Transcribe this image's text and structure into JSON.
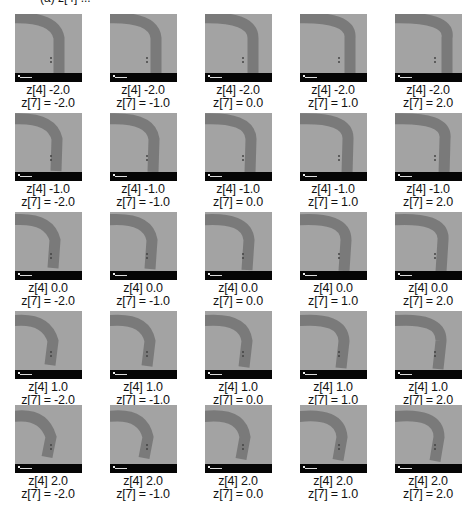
{
  "top_cutoff_text": "(a) z[4] ...",
  "colors": {
    "tile_bg": "#a3a3a3",
    "band": "#767676",
    "scale_bar": "#050505"
  },
  "grid": {
    "rows": 5,
    "cols": 5,
    "row_values": [
      "-2.0",
      "-1.0",
      "0.0",
      "1.0",
      "2.0"
    ],
    "col_values": [
      "-2.0",
      "-1.0",
      "0.0",
      "1.0",
      "2.0"
    ],
    "cells": [
      [
        {
          "l1": "z[4] -2.0",
          "l2": "z[7] = -2.0"
        },
        {
          "l1": "z[4] -2.0",
          "l2": "z[7] = -1.0"
        },
        {
          "l1": "z[4] -2.0",
          "l2": "z[7] = 0.0"
        },
        {
          "l1": "z[4] -2.0",
          "l2": "z[7] = 1.0"
        },
        {
          "l1": "z[4] -2.0",
          "l2": "z[7] = 2.0"
        }
      ],
      [
        {
          "l1": "z[4] -1.0",
          "l2": "z[7] = -2.0"
        },
        {
          "l1": "z[4] -1.0",
          "l2": "z[7] = -1.0"
        },
        {
          "l1": "z[4] -1.0",
          "l2": "z[7] = 0.0"
        },
        {
          "l1": "z[4] -1.0",
          "l2": "z[7] = 1.0"
        },
        {
          "l1": "z[4] -1.0",
          "l2": "z[7] = 2.0"
        }
      ],
      [
        {
          "l1": "z[4] 0.0",
          "l2": "z[7] = -2.0"
        },
        {
          "l1": "z[4] 0.0",
          "l2": "z[7] = -1.0"
        },
        {
          "l1": "z[4] 0.0",
          "l2": "z[7] = 0.0"
        },
        {
          "l1": "z[4] 0.0",
          "l2": "z[7] = 1.0"
        },
        {
          "l1": "z[4] 0.0",
          "l2": "z[7] = 2.0"
        }
      ],
      [
        {
          "l1": "z[4] 1.0",
          "l2": "z[7] = -2.0"
        },
        {
          "l1": "z[4] 1.0",
          "l2": "z[7] = -1.0"
        },
        {
          "l1": "z[4] 1.0",
          "l2": "z[7] = 0.0"
        },
        {
          "l1": "z[4] 1.0",
          "l2": "z[7] = 1.0"
        },
        {
          "l1": "z[4] 1.0",
          "l2": "z[7] = 2.0"
        }
      ],
      [
        {
          "l1": "z[4] 2.0",
          "l2": "z[7] = -2.0"
        },
        {
          "l1": "z[4] 2.0",
          "l2": "z[7] = -1.0"
        },
        {
          "l1": "z[4] 2.0",
          "l2": "z[7] = 0.0"
        },
        {
          "l1": "z[4] 2.0",
          "l2": "z[7] = 1.0"
        },
        {
          "l1": "z[4] 2.0",
          "l2": "z[7] = 2.0"
        }
      ]
    ]
  }
}
